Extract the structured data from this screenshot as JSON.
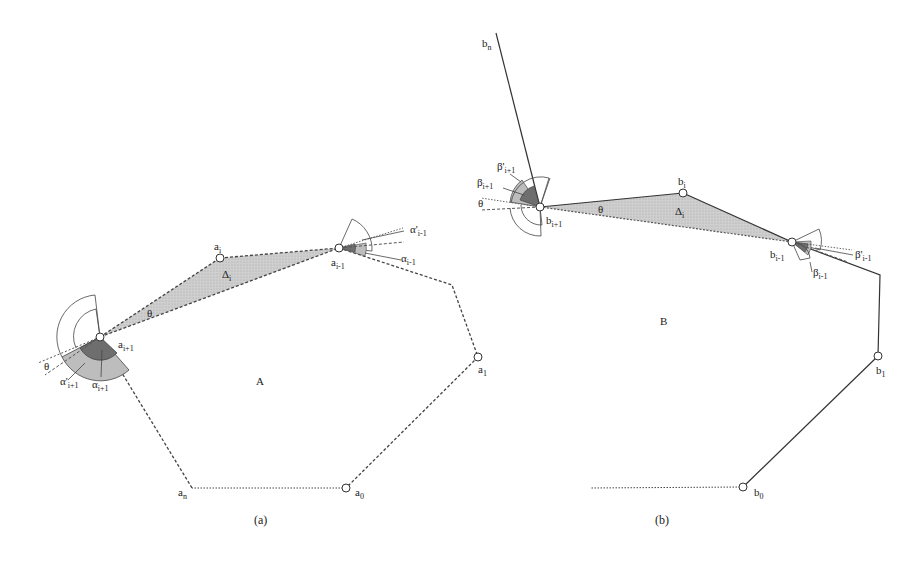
{
  "figure": {
    "panels": [
      {
        "id": "a",
        "caption": "(a)",
        "region_label": "A",
        "vertices": {
          "a_i_plus_1": {
            "base": "a",
            "sub": "i+1"
          },
          "a_i": {
            "base": "a",
            "sub": "i"
          },
          "a_i_minus_1": {
            "base": "a",
            "sub": "i-1"
          },
          "a_1": {
            "base": "a",
            "sub": "1"
          },
          "a_0": {
            "base": "a",
            "sub": "0"
          },
          "a_n": {
            "base": "a",
            "sub": "n"
          }
        },
        "triangle_label": {
          "base": "Δ",
          "sub": "i"
        },
        "theta_label": "θ",
        "angle_labels": {
          "alpha_i_plus_1": {
            "base": "α",
            "sub": "i+1"
          },
          "alpha_prime_i_plus_1": {
            "base": "α'",
            "sub": "i+1"
          },
          "alpha_i_minus_1": {
            "base": "α",
            "sub": "i-1"
          },
          "alpha_prime_i_minus_1": {
            "base": "α'",
            "sub": "i-1"
          }
        }
      },
      {
        "id": "b",
        "caption": "(b)",
        "region_label": "B",
        "vertices": {
          "b_n": {
            "base": "b",
            "sub": "n"
          },
          "b_i_plus_1": {
            "base": "b",
            "sub": "i+1"
          },
          "b_i": {
            "base": "b",
            "sub": "i"
          },
          "b_i_minus_1": {
            "base": "b",
            "sub": "i-1"
          },
          "b_1": {
            "base": "b",
            "sub": "1"
          },
          "b_0": {
            "base": "b",
            "sub": "0"
          }
        },
        "triangle_label": {
          "base": "Δ",
          "sub": "i"
        },
        "theta_label": "θ",
        "angle_labels": {
          "beta_i_plus_1": {
            "base": "β",
            "sub": "i+1"
          },
          "beta_prime_i_plus_1": {
            "base": "β'",
            "sub": "i+1"
          },
          "beta_i_minus_1": {
            "base": "β",
            "sub": "i-1"
          },
          "beta_prime_i_minus_1": {
            "base": "β'",
            "sub": "i-1"
          }
        }
      }
    ]
  },
  "colors": {
    "stroke": "#333333",
    "triangle_fill": "#c8c8c8",
    "dark_sector": "#6e6e6e",
    "light_sector": "#bdbdbd",
    "background": "#ffffff"
  }
}
